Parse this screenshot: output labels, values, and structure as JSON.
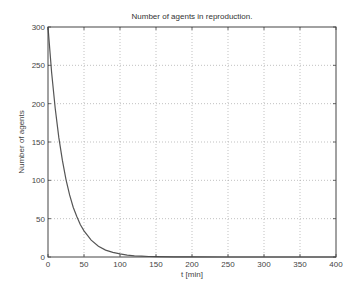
{
  "chart_data": {
    "type": "line",
    "title": "Number of agents in reproduction.",
    "xlabel": "t [min]",
    "ylabel": "Number of agents",
    "xlim": [
      0,
      400
    ],
    "ylim": [
      0,
      300
    ],
    "xticks": [
      0,
      50,
      100,
      150,
      200,
      250,
      300,
      350,
      400
    ],
    "yticks": [
      0,
      50,
      100,
      150,
      200,
      250,
      300
    ],
    "grid": true,
    "legend": null,
    "series": [
      {
        "name": "agents in reproduction",
        "color": "#555555",
        "x": [
          0,
          5,
          10,
          15,
          20,
          25,
          30,
          35,
          40,
          45,
          50,
          60,
          70,
          80,
          90,
          100,
          110,
          120,
          130,
          140,
          150,
          175,
          200,
          250,
          300,
          350,
          400
        ],
        "y": [
          300,
          241,
          194,
          156,
          126,
          101,
          81,
          65,
          53,
          42,
          34,
          22,
          14,
          9,
          6,
          4,
          2.5,
          1.6,
          1.1,
          0.7,
          0.5,
          0.2,
          0.1,
          0,
          0,
          0,
          0
        ]
      }
    ]
  }
}
